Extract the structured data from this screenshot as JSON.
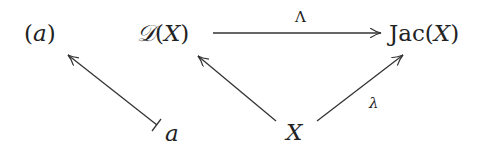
{
  "diagram": {
    "nodes": {
      "a_paren": {
        "open": "(",
        "var": "a",
        "close": ")"
      },
      "DX": {
        "sym": "𝒟",
        "open": "(",
        "var": "X",
        "close": ")"
      },
      "JacX": {
        "name": "Jac",
        "open": "(",
        "var": "X",
        "close": ")"
      },
      "a": {
        "var": "a"
      },
      "X": {
        "var": "X"
      }
    },
    "edges": [
      {
        "from": "DX",
        "to": "JacX",
        "label": "Λ",
        "style": "arrow"
      },
      {
        "from": "X",
        "to": "DX",
        "label": "",
        "style": "arrow"
      },
      {
        "from": "X",
        "to": "JacX",
        "label": "λ",
        "style": "arrow"
      },
      {
        "from": "a",
        "to": "a_paren",
        "label": "",
        "style": "mapsto"
      }
    ],
    "stroke_color": "#333333"
  }
}
